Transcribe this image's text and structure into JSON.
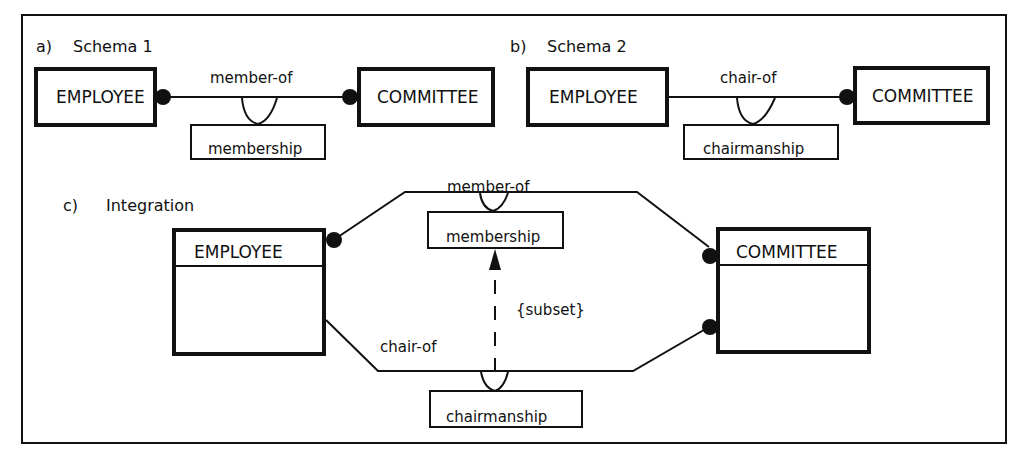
{
  "figure": {
    "panels": [
      {
        "id": "a",
        "marker": "a)",
        "title": "Schema 1",
        "left_entity": "EMPLOYEE",
        "right_entity": "COMMITTEE",
        "relationship": "member-of",
        "association_class": "membership"
      },
      {
        "id": "b",
        "marker": "b)",
        "title": "Schema 2",
        "left_entity": "EMPLOYEE",
        "right_entity": "COMMITTEE",
        "relationship": "chair-of",
        "association_class": "chairmanship"
      },
      {
        "id": "c",
        "marker": "c)",
        "title": "Integration",
        "left_entity": "EMPLOYEE",
        "right_entity": "COMMITTEE",
        "upper_relationship": "member-of",
        "upper_association_class": "membership",
        "lower_relationship": "chair-of",
        "lower_association_class": "chairmanship",
        "constraint": "{subset}"
      }
    ]
  },
  "colors": {
    "ink": "#111111",
    "background": "#ffffff"
  }
}
